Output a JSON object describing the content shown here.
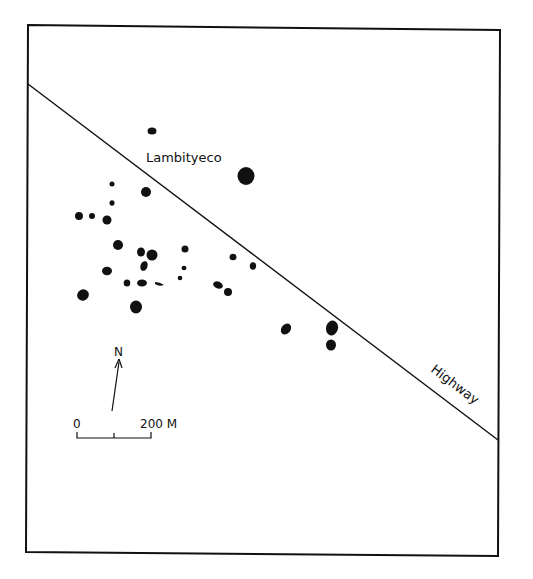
{
  "map": {
    "site_label": "Lambityeco",
    "road_label": "Highway",
    "north_label": "N",
    "scale": {
      "start_label": "0",
      "end_label": "200 M"
    },
    "ink_color": "#111111",
    "background_color": "#ffffff",
    "mound_count": 30
  }
}
